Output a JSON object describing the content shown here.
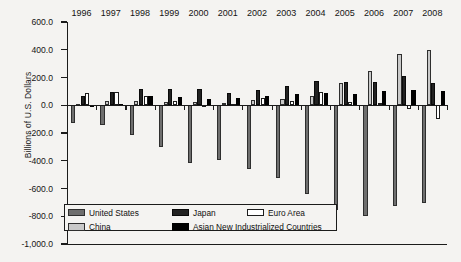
{
  "chart_data": {
    "type": "bar",
    "title": "",
    "subtitle": "",
    "xlabel": "",
    "ylabel": "Billions of U.S. Dollars",
    "ylim": [
      -1000.0,
      600.0
    ],
    "yticks": [
      600.0,
      400.0,
      200.0,
      0.0,
      -200.0,
      -400.0,
      -600.0,
      -800.0,
      -1000.0
    ],
    "ytick_labels": [
      "600.0",
      "400.0",
      "200.0",
      "0.0",
      "-200.0",
      "-400.0",
      "-600.0",
      "-800.0",
      "-1,000.0"
    ],
    "grid": false,
    "legend_position": "bottom-left",
    "categories": [
      "1996",
      "1997",
      "1998",
      "1999",
      "2000",
      "2001",
      "2002",
      "2003",
      "2004",
      "2005",
      "2006",
      "2007",
      "2008"
    ],
    "series": [
      {
        "name": "United States",
        "color": "#6e6e6e",
        "values": [
          -125,
          -140,
          -215,
          -300,
          -417,
          -395,
          -459,
          -522,
          -640,
          -755,
          -800,
          -726,
          -706
        ]
      },
      {
        "name": "China",
        "color": "#c9c9c9",
        "values": [
          7,
          30,
          31,
          21,
          20,
          17,
          35,
          46,
          69,
          161,
          250,
          372,
          400
        ]
      },
      {
        "name": "Japan",
        "color": "#222222",
        "values": [
          66,
          97,
          119,
          115,
          120,
          88,
          112,
          136,
          172,
          166,
          171,
          211,
          157
        ]
      },
      {
        "name": "Euro Area",
        "color": "#ffffff",
        "values": [
          85,
          96,
          65,
          32,
          5,
          12,
          55,
          33,
          92,
          22,
          18,
          -25,
          -100
        ]
      },
      {
        "name": "Asian New Industrialized Countries",
        "color": "#000000",
        "values": [
          3,
          9,
          66,
          56,
          42,
          55,
          67,
          80,
          85,
          82,
          100,
          109,
          100
        ]
      }
    ]
  },
  "legend": {
    "items": [
      {
        "label": "United States",
        "swatch": "us-swatch"
      },
      {
        "label": "Japan",
        "swatch": "japan-swatch"
      },
      {
        "label": "Euro Area",
        "swatch": "euro-swatch"
      },
      {
        "label": "China",
        "swatch": "china-swatch"
      },
      {
        "label": "Asian New Industrialized Countries",
        "swatch": "anic-swatch"
      }
    ]
  }
}
